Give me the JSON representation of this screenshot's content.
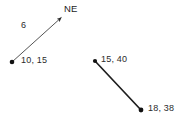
{
  "canvas": {
    "width": 183,
    "height": 125,
    "background": "#ffffff"
  },
  "diagram": {
    "type": "vector-diagram",
    "stroke_color": "#3a3a3a",
    "stroke_color_dark": "#1a1a1a",
    "point_color": "#111111",
    "vectors": [
      {
        "id": "ne-vector",
        "kind": "arrow",
        "start": {
          "x": 12,
          "y": 62
        },
        "end": {
          "x": 63,
          "y": 16
        },
        "start_point_label": "10, 15",
        "magnitude_label": "6",
        "direction_label": "NE",
        "has_arrowhead": true,
        "has_start_dot": true,
        "stroke_width": 1
      },
      {
        "id": "segment-vector",
        "kind": "segment",
        "start": {
          "x": 95,
          "y": 61
        },
        "end": {
          "x": 141,
          "y": 110
        },
        "start_point_label": "15, 40",
        "end_point_label": "18, 38",
        "has_arrowhead": false,
        "has_start_dot": true,
        "has_end_dot": true,
        "stroke_width": 2
      }
    ],
    "labels": {
      "direction_ne": "NE",
      "magnitude_6": "6",
      "point_10_15": "10, 15",
      "point_15_40": "15, 40",
      "point_18_38": "18, 38"
    }
  }
}
